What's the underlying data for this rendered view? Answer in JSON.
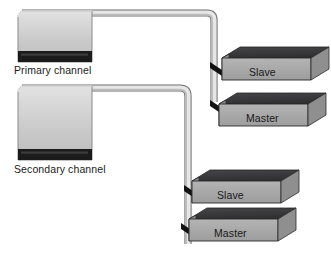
{
  "diagram": {
    "background_color": "#ffffff",
    "colors": {
      "connector_face": "#cfcfcf",
      "connector_band": "#1b1b1b",
      "cable_fill": "#d5d5d5",
      "cable_edge": "#6e6e6e",
      "drive_top": "#3a3a3c",
      "drive_front": "#a8a8a8",
      "drive_side": "#8c8c8c",
      "drive_outline": "#2b2b2b",
      "plug_dark": "#141414",
      "text": "#1a1a1a"
    },
    "channels": [
      {
        "id": "primary",
        "label": "Primary channel",
        "connector_name": "primary-channel-connector"
      },
      {
        "id": "secondary",
        "label": "Secondary channel",
        "connector_name": "secondary-channel-connector"
      }
    ],
    "drives": [
      {
        "id": "primary-slave",
        "label": "Slave",
        "channel": "primary"
      },
      {
        "id": "primary-master",
        "label": "Master",
        "channel": "primary"
      },
      {
        "id": "secondary-slave",
        "label": "Slave",
        "channel": "secondary"
      },
      {
        "id": "secondary-master",
        "label": "Master",
        "channel": "secondary"
      }
    ]
  }
}
